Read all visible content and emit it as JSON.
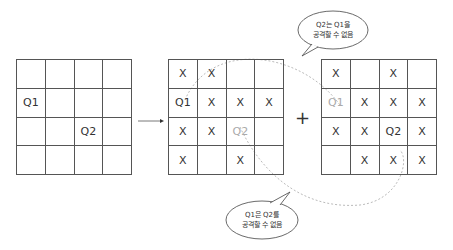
{
  "grids": [
    {
      "id": "initial",
      "cells": [
        [
          "",
          "",
          "",
          ""
        ],
        [
          "Q1",
          "",
          "",
          ""
        ],
        [
          "",
          "",
          "Q2",
          ""
        ],
        [
          "",
          "",
          "",
          ""
        ]
      ],
      "faded": []
    },
    {
      "id": "q1-attack",
      "cells": [
        [
          "X",
          "X",
          "",
          ""
        ],
        [
          "Q1",
          "X",
          "X",
          "X"
        ],
        [
          "X",
          "X",
          "Q2",
          ""
        ],
        [
          "X",
          "",
          "X",
          ""
        ]
      ],
      "faded": [
        "2-2"
      ]
    },
    {
      "id": "q2-attack",
      "cells": [
        [
          "X",
          "",
          "X",
          ""
        ],
        [
          "Q1",
          "X",
          "X",
          "X"
        ],
        [
          "X",
          "X",
          "Q2",
          "X"
        ],
        [
          "",
          "X",
          "X",
          "X"
        ]
      ],
      "faded": [
        "1-0"
      ]
    }
  ],
  "operators": {
    "arrow": "→",
    "plus": "+"
  },
  "bubbles": {
    "top": {
      "line1": "Q2는 Q1을",
      "line2": "공격할 수 없음"
    },
    "bottom": {
      "line1": "Q1은 Q2를",
      "line2": "공격할 수 없음"
    }
  }
}
